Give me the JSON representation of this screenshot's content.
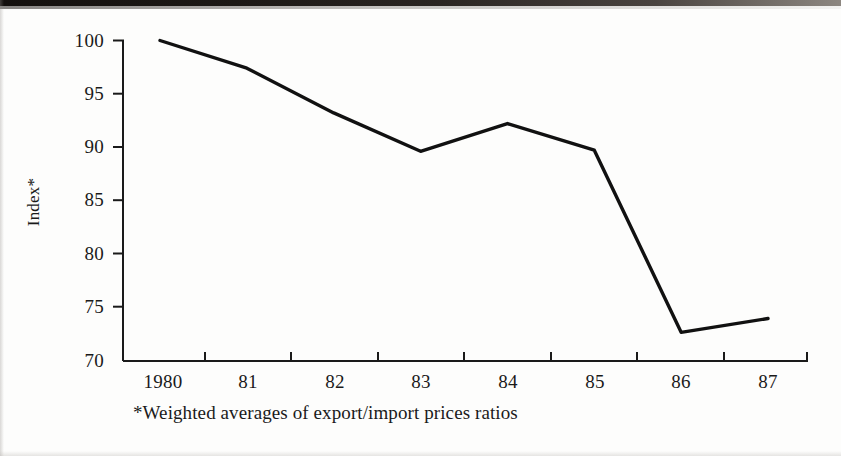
{
  "figure": {
    "y_axis_label": "Index*",
    "caption": "*Weighted averages of export/import prices ratios"
  },
  "chart_data": {
    "type": "line",
    "title": "",
    "subtitle": "",
    "xlabel": "",
    "ylabel": "Index*",
    "annotations": [
      "*Weighted averages of export/import prices ratios"
    ],
    "categories": [
      "1980",
      "81",
      "82",
      "83",
      "84",
      "85",
      "86",
      "87"
    ],
    "x_tick_labels": [
      "1980",
      "81",
      "82",
      "83",
      "84",
      "85",
      "86",
      "87"
    ],
    "y_tick_labels": [
      "70",
      "75",
      "80",
      "85",
      "90",
      "95",
      "100"
    ],
    "y_ticks": [
      70,
      75,
      80,
      85,
      90,
      95,
      100
    ],
    "ylim": [
      70,
      100
    ],
    "values": [
      100.0,
      97.4,
      93.2,
      89.6,
      92.2,
      89.7,
      72.6,
      73.9
    ],
    "series": [
      {
        "name": "Index*",
        "color": "#111111",
        "values": [
          100.0,
          97.4,
          93.2,
          89.6,
          92.2,
          89.7,
          72.6,
          73.9
        ]
      }
    ],
    "grid": false,
    "legend": "none",
    "line_color": "#111111",
    "line_width": 3
  }
}
